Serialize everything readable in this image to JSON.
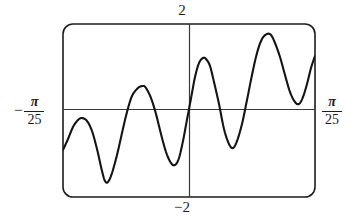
{
  "figure": {
    "type": "calculator-viewport",
    "frame": {
      "corner_radius": 10,
      "stroke_color": "#1d1d1d",
      "background": "#ffffff"
    }
  },
  "labels": {
    "y_max": "2",
    "y_min": "−2",
    "x_min_sign": "−",
    "x_min_numerator": "π",
    "x_min_denominator": "25",
    "x_max_numerator": "π",
    "x_max_denominator": "25"
  },
  "colors": {
    "curve": "#141414",
    "axis": "#3a3a3a",
    "frame": "#1d1d1d",
    "background": "#ffffff"
  },
  "chart_data": {
    "type": "line",
    "title": "",
    "subtitle": "",
    "xlabel": "",
    "ylabel": "",
    "grid": false,
    "legend": null,
    "legend_position": "none",
    "axes": {
      "x_axis_drawn": true,
      "y_axis_drawn": true,
      "x_zero_at_center": true,
      "y_zero_at_center": true
    },
    "xlim": [
      -0.12566370614359174,
      0.12566370614359174
    ],
    "ylim": [
      -2,
      2
    ],
    "xtick_labels": [
      "−π/25",
      "π/25"
    ],
    "ytick_labels": [
      "−2",
      "2"
    ],
    "annotations": [
      {
        "text": "2",
        "position": "top-center",
        "refers_to": "y maximum of viewing window"
      },
      {
        "text": "−2",
        "position": "bottom-center",
        "refers_to": "y minimum of viewing window"
      },
      {
        "text": "−π/25",
        "position": "left-middle",
        "refers_to": "x minimum of viewing window"
      },
      {
        "text": "π/25",
        "position": "right-middle",
        "refers_to": "x maximum of viewing window"
      }
    ],
    "series": [
      {
        "name": "curve",
        "color": "#141414",
        "points_px": [
          [
            63,
            150
          ],
          [
            68,
            139
          ],
          [
            73,
            127
          ],
          [
            78,
            120
          ],
          [
            82,
            118
          ],
          [
            87,
            121
          ],
          [
            92,
            131
          ],
          [
            97,
            149
          ],
          [
            102,
            171
          ],
          [
            105,
            181
          ],
          [
            108,
            182
          ],
          [
            112,
            173
          ],
          [
            117,
            155
          ],
          [
            122,
            133
          ],
          [
            127,
            112
          ],
          [
            132,
            96
          ],
          [
            138,
            88
          ],
          [
            143,
            86
          ],
          [
            146,
            88
          ],
          [
            151,
            98
          ],
          [
            156,
            114
          ],
          [
            161,
            134
          ],
          [
            166,
            152
          ],
          [
            171,
            163
          ],
          [
            175,
            165
          ],
          [
            179,
            158
          ],
          [
            183,
            141
          ],
          [
            186,
            125
          ],
          [
            189,
            109
          ],
          [
            192,
            93
          ],
          [
            195,
            77
          ],
          [
            199,
            63
          ],
          [
            203,
            58
          ],
          [
            206,
            59
          ],
          [
            210,
            66
          ],
          [
            214,
            82
          ],
          [
            219,
            104
          ],
          [
            224,
            129
          ],
          [
            229,
            144
          ],
          [
            233,
            148
          ],
          [
            237,
            141
          ],
          [
            242,
            124
          ],
          [
            247,
            100
          ],
          [
            252,
            75
          ],
          [
            257,
            53
          ],
          [
            262,
            39
          ],
          [
            267,
            34
          ],
          [
            271,
            35
          ],
          [
            275,
            43
          ],
          [
            280,
            57
          ],
          [
            285,
            75
          ],
          [
            290,
            92
          ],
          [
            295,
            102
          ],
          [
            299,
            104
          ],
          [
            303,
            97
          ],
          [
            307,
            84
          ],
          [
            311,
            68
          ],
          [
            315,
            56
          ]
        ],
        "points_math": [
          [
            -0.1257,
            -0.68
          ],
          [
            -0.1134,
            0.1
          ],
          [
            -0.1042,
            1.1
          ],
          [
            -0.0925,
            -0.93
          ],
          [
            -0.0835,
            -1.47
          ],
          [
            -0.0706,
            0.55
          ],
          [
            -0.058,
            1.18
          ],
          [
            -0.047,
            -0.3
          ],
          [
            -0.037,
            -1.14
          ],
          [
            -0.0228,
            0.62
          ],
          [
            -0.01,
            1.08
          ],
          [
            0.0,
            0.0
          ],
          [
            0.01,
            -1.08
          ],
          [
            0.0228,
            -0.62
          ],
          [
            0.037,
            1.14
          ],
          [
            0.047,
            0.3
          ],
          [
            0.058,
            -1.18
          ],
          [
            0.0706,
            -0.55
          ],
          [
            0.0835,
            1.47
          ],
          [
            0.0925,
            0.93
          ],
          [
            0.1042,
            -1.1
          ],
          [
            0.1134,
            -0.1
          ],
          [
            0.1257,
            0.68
          ]
        ]
      }
    ]
  }
}
